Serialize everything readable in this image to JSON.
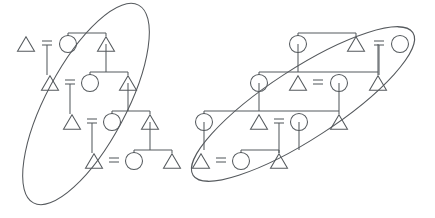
{
  "figure": {
    "title": "Kinship diagram with two circled descent groups",
    "type": "kinship-genealogy-diagram",
    "width": 435,
    "height": 218,
    "background_color": "#ffffff",
    "stroke_color": "#555a5e",
    "stroke_width": 1.05,
    "symbol_legend": {
      "triangle": "male individual",
      "circle": "female individual",
      "equals": "marriage / union",
      "ellipse": "descent group boundary"
    }
  },
  "nodes": [
    {
      "id": "L1-m",
      "symbol": "triangle",
      "cx": 26,
      "cy": 44,
      "size": 17,
      "group": "left-cluster"
    },
    {
      "id": "L1-f",
      "symbol": "circle",
      "cx": 68,
      "cy": 44,
      "size": 17,
      "group": "left-cluster"
    },
    {
      "id": "L1-s",
      "symbol": "triangle",
      "cx": 106,
      "cy": 44,
      "size": 17,
      "group": "left-cluster"
    },
    {
      "id": "L2-m",
      "symbol": "triangle",
      "cx": 50,
      "cy": 83,
      "size": 17,
      "group": "left-cluster"
    },
    {
      "id": "L2-f",
      "symbol": "circle",
      "cx": 90,
      "cy": 83,
      "size": 17,
      "group": "left-cluster"
    },
    {
      "id": "L2-s",
      "symbol": "triangle",
      "cx": 128,
      "cy": 83,
      "size": 17,
      "group": "left-cluster"
    },
    {
      "id": "L3-m",
      "symbol": "triangle",
      "cx": 72,
      "cy": 122,
      "size": 17,
      "group": "left-cluster"
    },
    {
      "id": "L3-f",
      "symbol": "circle",
      "cx": 112,
      "cy": 122,
      "size": 17,
      "group": "left-cluster"
    },
    {
      "id": "L3-s",
      "symbol": "triangle",
      "cx": 150,
      "cy": 122,
      "size": 17,
      "group": "left-cluster"
    },
    {
      "id": "L4-m",
      "symbol": "triangle",
      "cx": 94,
      "cy": 161,
      "size": 17,
      "group": "left-cluster"
    },
    {
      "id": "L4-f",
      "symbol": "circle",
      "cx": 134,
      "cy": 161,
      "size": 17,
      "group": "left-cluster"
    },
    {
      "id": "L4-s",
      "symbol": "triangle",
      "cx": 172,
      "cy": 161,
      "size": 17,
      "group": "left-cluster"
    },
    {
      "id": "R1-f",
      "symbol": "circle",
      "cx": 298,
      "cy": 44,
      "size": 17,
      "group": "right-cluster"
    },
    {
      "id": "R1-s",
      "symbol": "triangle",
      "cx": 356,
      "cy": 44,
      "size": 17,
      "group": "right-cluster"
    },
    {
      "id": "R1-f2",
      "symbol": "circle",
      "cx": 400,
      "cy": 44,
      "size": 17,
      "group": "right-cluster"
    },
    {
      "id": "R2-f",
      "symbol": "circle",
      "cx": 259,
      "cy": 83,
      "size": 17,
      "group": "right-cluster"
    },
    {
      "id": "R2-m",
      "symbol": "triangle",
      "cx": 298,
      "cy": 83,
      "size": 17,
      "group": "right-cluster"
    },
    {
      "id": "R2-f2",
      "symbol": "circle",
      "cx": 339,
      "cy": 83,
      "size": 17,
      "group": "right-cluster"
    },
    {
      "id": "R2-s",
      "symbol": "triangle",
      "cx": 378,
      "cy": 83,
      "size": 17,
      "group": "right-cluster"
    },
    {
      "id": "R3-f",
      "symbol": "circle",
      "cx": 204,
      "cy": 122,
      "size": 17,
      "group": "right-cluster"
    },
    {
      "id": "R3-m",
      "symbol": "triangle",
      "cx": 259,
      "cy": 122,
      "size": 17,
      "group": "right-cluster"
    },
    {
      "id": "R3-f2",
      "symbol": "circle",
      "cx": 299,
      "cy": 122,
      "size": 17,
      "group": "right-cluster"
    },
    {
      "id": "R3-s",
      "symbol": "triangle",
      "cx": 339,
      "cy": 122,
      "size": 17,
      "group": "right-cluster"
    },
    {
      "id": "R4-m",
      "symbol": "triangle",
      "cx": 201,
      "cy": 161,
      "size": 17,
      "group": "right-cluster"
    },
    {
      "id": "R4-f",
      "symbol": "circle",
      "cx": 241,
      "cy": 161,
      "size": 17,
      "group": "right-cluster"
    },
    {
      "id": "R4-s",
      "symbol": "triangle",
      "cx": 279,
      "cy": 161,
      "size": 17,
      "group": "right-cluster"
    }
  ],
  "marriages": [
    {
      "id": "M-L1",
      "label": "=",
      "x": 47,
      "y": 44,
      "descent_to_y": 75
    },
    {
      "id": "M-L2",
      "label": "=",
      "x": 70,
      "y": 83,
      "descent_to_y": 114
    },
    {
      "id": "M-L3",
      "label": "=",
      "x": 92,
      "y": 122,
      "descent_to_y": 153
    },
    {
      "id": "M-L4",
      "label": "=",
      "x": 114,
      "y": 161,
      "descent_to_y": 161
    },
    {
      "id": "M-R1",
      "label": "=",
      "x": 379,
      "y": 44,
      "descent_to_y": 75
    },
    {
      "id": "M-R2",
      "label": "=",
      "x": 318,
      "y": 83,
      "descent_to_y": 83
    },
    {
      "id": "M-R3",
      "label": "=",
      "x": 279,
      "y": 122,
      "descent_to_y": 153
    },
    {
      "id": "M-R4",
      "label": "=",
      "x": 221,
      "y": 161,
      "descent_to_y": 161
    }
  ],
  "sibling_links": [
    {
      "id": "SL-1",
      "from": "L1-f",
      "to": "L1-s",
      "bar_y": 33,
      "x1": 68,
      "x2": 106
    },
    {
      "id": "SL-2",
      "from": "L2-f",
      "to": "L2-s",
      "bar_y": 72,
      "x1": 90,
      "x2": 128
    },
    {
      "id": "SL-3",
      "from": "L3-f",
      "to": "L3-s",
      "bar_y": 111,
      "x1": 112,
      "x2": 150
    },
    {
      "id": "SL-4",
      "from": "L4-f",
      "to": "L4-s",
      "bar_y": 150,
      "x1": 134,
      "x2": 172
    },
    {
      "id": "SR-1",
      "from": "R1-f",
      "to": "R1-s",
      "bar_y": 33,
      "x1": 298,
      "x2": 356
    },
    {
      "id": "SR-2",
      "from": "R2-f",
      "to": "R2-s",
      "bar_y": 72,
      "x1": 259,
      "x2": 378
    },
    {
      "id": "SR-3",
      "from": "R3-f",
      "to": "R3-s",
      "bar_y": 111,
      "x1": 204,
      "x2": 339
    },
    {
      "id": "SR-4",
      "from": "R4-f",
      "to": "R4-s",
      "bar_y": 150,
      "x1": 241,
      "x2": 279
    }
  ],
  "descent_lines": [
    {
      "id": "DL-1",
      "x": 106,
      "y1": 44,
      "y2": 72
    },
    {
      "id": "DL-2",
      "x": 128,
      "y1": 83,
      "y2": 111
    },
    {
      "id": "DL-3",
      "x": 150,
      "y1": 122,
      "y2": 150
    },
    {
      "id": "DR-1",
      "x": 298,
      "y1": 44,
      "y2": 72
    },
    {
      "id": "DR-2",
      "x": 378,
      "y1": 44,
      "y2": 72
    },
    {
      "id": "DR-3",
      "x": 259,
      "y1": 83,
      "y2": 111
    },
    {
      "id": "DR-4",
      "x": 339,
      "y1": 83,
      "y2": 111
    },
    {
      "id": "DR-5",
      "x": 204,
      "y1": 122,
      "y2": 150
    },
    {
      "id": "DR-6",
      "x": 299,
      "y1": 122,
      "y2": 150
    }
  ],
  "groups": [
    {
      "id": "left-ellipse",
      "label": "left descent group",
      "cx": 86,
      "cy": 104,
      "rx": 112,
      "ry": 40,
      "rotation": -62
    },
    {
      "id": "right-ellipse",
      "label": "right descent group",
      "cx": 303,
      "cy": 104,
      "rx": 131,
      "ry": 35,
      "rotation": -33
    }
  ]
}
